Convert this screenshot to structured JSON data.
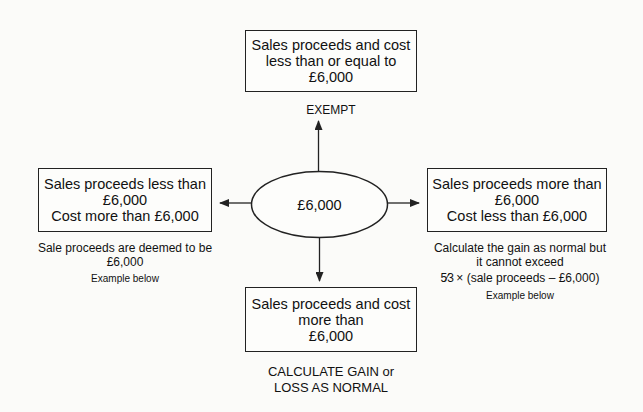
{
  "center": {
    "label": "£6,000"
  },
  "top": {
    "box_lines": [
      "Sales proceeds and cost",
      "less than or equal to",
      "£6,000"
    ],
    "result": "EXEMPT"
  },
  "left": {
    "box_lines": [
      "Sales proceeds less than",
      "£6,000",
      "Cost more than £6,000"
    ],
    "note_lines": [
      "Sale proceeds are deemed to be",
      "£6,000"
    ],
    "example": "Example below"
  },
  "right": {
    "box_lines": [
      "Sales proceeds more than",
      "£6,000",
      "Cost less than £6,000"
    ],
    "note_lines": [
      "Calculate the gain as normal but",
      "it cannot exceed"
    ],
    "formula_fraction": "5⁄3",
    "formula_rest": " × (sale proceeds – £6,000)",
    "example": "Example below"
  },
  "bottom": {
    "box_lines": [
      "Sales proceeds and cost",
      "more than",
      "£6,000"
    ],
    "result_lines": [
      "CALCULATE GAIN or",
      "LOSS AS NORMAL"
    ]
  },
  "colors": {
    "line": "#222222",
    "background": "#fbfbf9"
  }
}
